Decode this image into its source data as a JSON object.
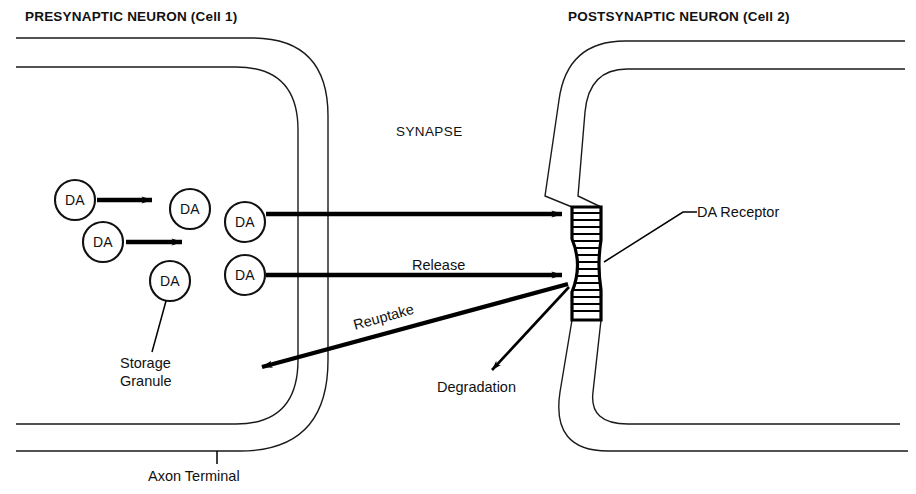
{
  "figure": {
    "title_presynaptic": "PRESYNAPTIC NEURON (Cell 1)",
    "title_postsynaptic": "POSTSYNAPTIC NEURON (Cell 2)",
    "synapse_label": "SYNAPSE",
    "background_color": "#ffffff",
    "ink_color": "#111111"
  },
  "labels": {
    "release": "Release",
    "reuptake": "Reuptake",
    "degradation": "Degradation",
    "da_receptor": "DA Receptor",
    "storage_granule_line1": "Storage",
    "storage_granule_line2": "Granule",
    "axon_terminal": "Axon Terminal"
  },
  "granules": [
    {
      "id": "da-1",
      "text": "DA",
      "cx": 75,
      "cy": 200,
      "r": 20
    },
    {
      "id": "da-2",
      "text": "DA",
      "cx": 190,
      "cy": 209,
      "r": 20
    },
    {
      "id": "da-3",
      "text": "DA",
      "cx": 245,
      "cy": 222,
      "r": 20
    },
    {
      "id": "da-4",
      "text": "DA",
      "cx": 103,
      "cy": 242,
      "r": 20
    },
    {
      "id": "da-5",
      "text": "DA",
      "cx": 170,
      "cy": 281,
      "r": 20
    },
    {
      "id": "da-6",
      "text": "DA",
      "cx": 245,
      "cy": 275,
      "r": 20
    }
  ],
  "receptor": {
    "name": "DA Receptor",
    "hatch_count": 17,
    "top_y": 207,
    "bottom_y": 320,
    "left_x": 572,
    "right_x": 601
  },
  "arrows": [
    {
      "id": "granule-move-1",
      "kind": "short-thick",
      "from": [
        97,
        200
      ],
      "to": [
        160,
        200
      ]
    },
    {
      "id": "granule-move-2",
      "kind": "short-thick",
      "from": [
        126,
        242
      ],
      "to": [
        190,
        242
      ]
    },
    {
      "id": "release-upper",
      "kind": "long-thick",
      "from": [
        266,
        214
      ],
      "to": [
        568,
        214
      ]
    },
    {
      "id": "release-lower",
      "kind": "long-thick",
      "from": [
        266,
        275
      ],
      "to": [
        568,
        275
      ]
    },
    {
      "id": "reuptake",
      "kind": "long-thick",
      "from": [
        568,
        285
      ],
      "to": [
        256,
        369
      ]
    },
    {
      "id": "degradation",
      "kind": "thin",
      "from": [
        568,
        288
      ],
      "to": [
        488,
        374
      ]
    }
  ]
}
